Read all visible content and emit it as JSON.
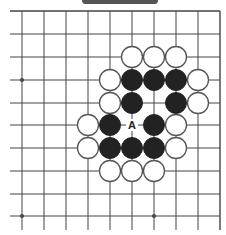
{
  "diagram": {
    "type": "go-board-fragment",
    "colors": {
      "line": "#444444",
      "black_stone": "#222222",
      "white_stone": "#ffffff",
      "white_stroke": "#555555",
      "label": "#222222",
      "top_bar": "#555555"
    },
    "grid": {
      "cols_x": [
        22,
        44,
        66,
        88,
        110,
        132,
        154,
        176,
        198,
        220
      ],
      "rows_y": [
        11,
        34,
        57,
        80,
        103,
        125,
        148,
        171,
        194,
        216
      ],
      "left_extend_to": 10,
      "bottom_extend_to": 230,
      "top_edge": true,
      "right_edge": true
    },
    "star_points": [
      [
        0,
        3
      ],
      [
        0,
        9
      ],
      [
        6,
        9
      ]
    ],
    "stones": {
      "black": [
        [
          5,
          3
        ],
        [
          6,
          3
        ],
        [
          7,
          3
        ],
        [
          5,
          4
        ],
        [
          7,
          4
        ],
        [
          4,
          5
        ],
        [
          6,
          5
        ],
        [
          4,
          6
        ],
        [
          5,
          6
        ],
        [
          6,
          6
        ]
      ],
      "white": [
        [
          5,
          2
        ],
        [
          6,
          2
        ],
        [
          7,
          2
        ],
        [
          4,
          3
        ],
        [
          8,
          3
        ],
        [
          4,
          4
        ],
        [
          8,
          4
        ],
        [
          3,
          5
        ],
        [
          7,
          5
        ],
        [
          3,
          6
        ],
        [
          7,
          6
        ],
        [
          4,
          7
        ],
        [
          5,
          7
        ],
        [
          6,
          7
        ]
      ]
    },
    "labels": [
      {
        "text": "A",
        "col": 5,
        "row": 5
      }
    ]
  }
}
